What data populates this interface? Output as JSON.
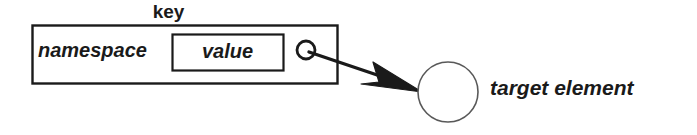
{
  "diagram": {
    "title_label": "key",
    "namespace_label": "namespace",
    "value_label": "value",
    "target_label": "target element",
    "anchor_point_name": "anchor-circle",
    "arrow_name": "pointer-arrow",
    "colors": {
      "stroke": "#1a1a1a",
      "fill": "#ffffff",
      "arrow_fill": "#1a1a1a",
      "target_stroke": "#595959",
      "background": "#ffffff"
    },
    "geometry": {
      "key_box": {
        "x": 32,
        "y": 25,
        "w": 305,
        "h": 58
      },
      "value_box": {
        "x": 172,
        "y": 34,
        "w": 111,
        "h": 36
      },
      "anchor_circle": {
        "cx": 306,
        "cy": 50,
        "r": 9
      },
      "target_circle": {
        "cx": 448,
        "cy": 92,
        "r": 30
      },
      "arrow": {
        "x1": 313,
        "y1": 54,
        "x2": 418,
        "y2": 90
      }
    }
  }
}
